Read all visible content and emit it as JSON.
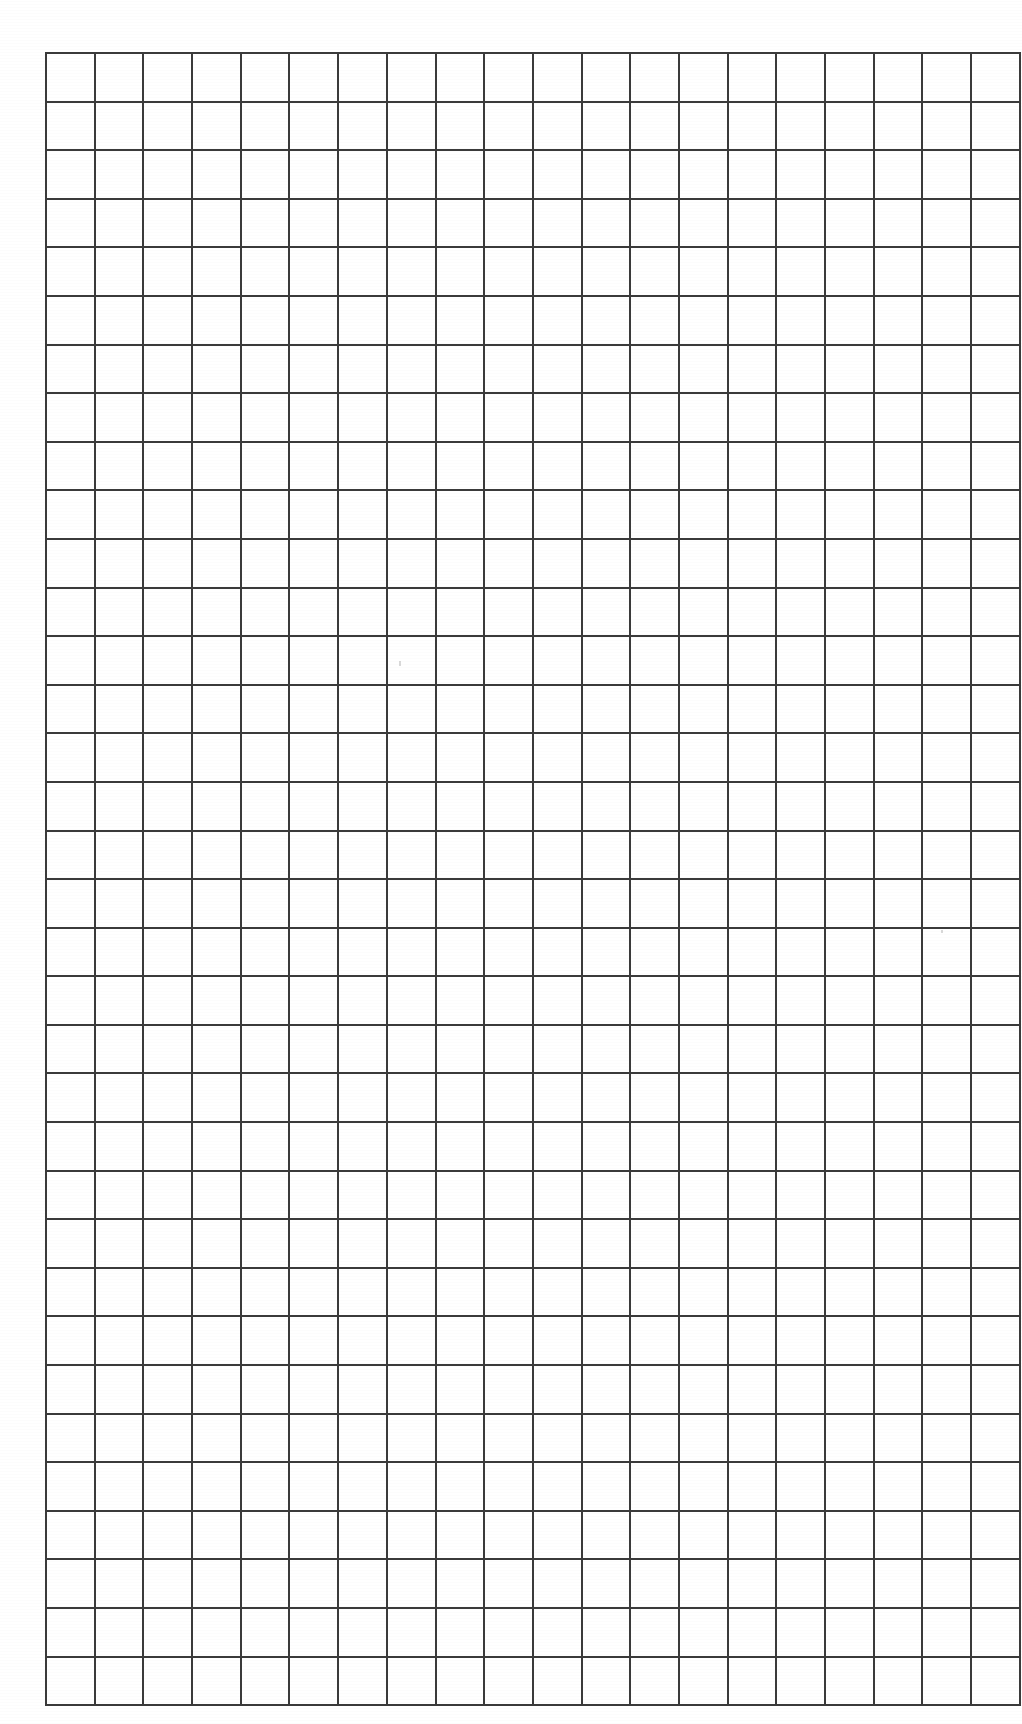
{
  "document": {
    "title": "Blank Grid Worksheet",
    "kind": "graph-paper-sheet",
    "page_width": 1022,
    "page_height": 1724,
    "background_color": "#ffffff",
    "text_content": "",
    "labels": [],
    "annotations": []
  },
  "grid": {
    "columns": 20,
    "rows": 34,
    "cell_width": 46.7,
    "cell_height": 46.6,
    "line_color": "#3a3a3a",
    "line_width": 2,
    "fill_color": "#ffffff",
    "offset_x": 45,
    "offset_y": 52,
    "total_width": 934,
    "total_height": 1584,
    "cells": []
  },
  "marks": [
    {
      "name": "scan-speck-center",
      "x": 399,
      "y": 661,
      "width": 2,
      "height": 5
    },
    {
      "name": "scan-speck-right",
      "x": 941,
      "y": 930,
      "width": 2,
      "height": 3
    }
  ],
  "margins": {
    "left": 45,
    "top": 52,
    "right": 43,
    "bottom": 89
  }
}
